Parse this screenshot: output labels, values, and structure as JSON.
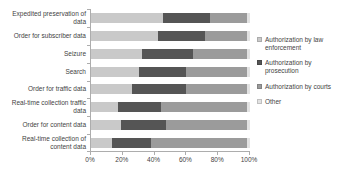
{
  "chart_data": {
    "type": "bar",
    "stacked": true,
    "orientation": "horizontal",
    "unit": "percent",
    "title": "",
    "xlabel": "",
    "ylabel": "",
    "xlim": [
      0,
      100
    ],
    "grid": false,
    "legend_position": "right",
    "categories": [
      "Expedited preservation of data",
      "Order for subscriber data",
      "Seizure",
      "Search",
      "Order for traffic data",
      "Real-time collection traffic data",
      "Order for content data",
      "Real-time collection of content data"
    ],
    "series": [
      {
        "name": "Authorization by law enforcement",
        "color": "#c9c9c9",
        "values": [
          45,
          42,
          32,
          30,
          26,
          17,
          19,
          13
        ]
      },
      {
        "name": "Authorization by prosecution",
        "color": "#555555",
        "values": [
          30,
          30,
          32,
          30,
          34,
          27,
          28,
          25
        ]
      },
      {
        "name": "Authorization by courts",
        "color": "#9b9b9b",
        "values": [
          23,
          26,
          34,
          38,
          38,
          54,
          51,
          60
        ]
      },
      {
        "name": "Other",
        "color": "#e2e2e2",
        "values": [
          2,
          2,
          2,
          2,
          2,
          2,
          2,
          2
        ]
      }
    ],
    "x_ticks": [
      "0%",
      "20%",
      "40%",
      "60%",
      "80%",
      "100%"
    ],
    "axis_color": "#adadad",
    "text_color": "#3f3f3f"
  }
}
